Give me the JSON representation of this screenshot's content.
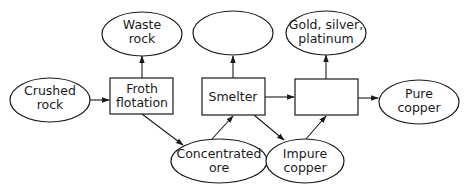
{
  "diagram": {
    "nodes": {
      "crushed_rock": {
        "type": "ellipse",
        "line1": "Crushed",
        "line2": "rock"
      },
      "froth_flotation": {
        "type": "box",
        "line1": "Froth",
        "line2": "flotation"
      },
      "waste_rock": {
        "type": "ellipse",
        "line1": "Waste",
        "line2": "rock"
      },
      "concentrated_ore": {
        "type": "ellipse",
        "line1": "Concentrated",
        "line2": "ore"
      },
      "smelter": {
        "type": "box",
        "line1": "Smelter"
      },
      "blank_output": {
        "type": "ellipse",
        "line1": ""
      },
      "impure_copper": {
        "type": "ellipse",
        "line1": "Impure",
        "line2": "copper"
      },
      "blank_process": {
        "type": "box",
        "line1": ""
      },
      "precious_metals": {
        "type": "ellipse",
        "line1": "Gold, silver,",
        "line2": "platinum"
      },
      "pure_copper": {
        "type": "ellipse",
        "line1": "Pure",
        "line2": "copper"
      }
    },
    "edges": [
      {
        "from": "Crushed rock",
        "to": "Froth flotation"
      },
      {
        "from": "Froth flotation",
        "to": "Waste rock"
      },
      {
        "from": "Froth flotation",
        "to": "Concentrated ore"
      },
      {
        "from": "Concentrated ore",
        "to": "Smelter"
      },
      {
        "from": "Smelter",
        "to": "(blank output)"
      },
      {
        "from": "Smelter",
        "to": "(blank process)"
      },
      {
        "from": "Smelter",
        "to": "Impure copper"
      },
      {
        "from": "Impure copper",
        "to": "(blank process)"
      },
      {
        "from": "(blank process)",
        "to": "Gold, silver, platinum"
      },
      {
        "from": "(blank process)",
        "to": "Pure copper"
      }
    ],
    "colors": {
      "stroke": "#1a1a1a",
      "fill": "#ffffff",
      "text": "#1a1a1a"
    }
  }
}
